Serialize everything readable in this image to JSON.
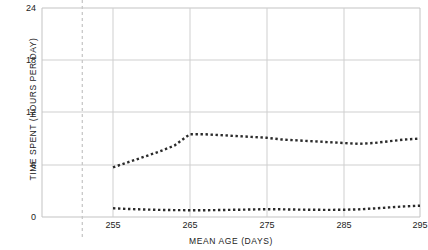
{
  "chart_data": {
    "type": "line",
    "title": "",
    "xlabel": "MEAN AGE (DAYS)",
    "ylabel": "TIME SPENT (HOURS PER DAY)",
    "xlim": [
      247,
      295
    ],
    "ylim": [
      0,
      24
    ],
    "xticks": [
      255,
      265,
      275,
      285,
      295
    ],
    "yticks": [
      0,
      6,
      12,
      18,
      24
    ],
    "xticklabels": [
      "255",
      "265",
      "275",
      "285",
      "295"
    ],
    "yticklabels": [
      "0",
      "6",
      "12",
      "18",
      "24"
    ],
    "grid": "both",
    "legend": "none",
    "annotations": [
      {
        "name": "reference-line",
        "type": "vline",
        "x": 251,
        "style": "dashed",
        "color": "#c8c8c8"
      }
    ],
    "series": [
      {
        "name": "upper-series",
        "style": "dotted",
        "color": "#2b2b2b",
        "x": [
          255,
          257,
          259,
          261,
          263,
          265,
          267,
          269,
          271,
          273,
          275,
          277,
          279,
          281,
          283,
          285,
          287,
          289,
          291,
          293,
          295
        ],
        "values": [
          5.7,
          6.3,
          6.9,
          7.5,
          8.2,
          9.5,
          9.5,
          9.4,
          9.3,
          9.2,
          9.1,
          8.9,
          8.8,
          8.7,
          8.6,
          8.5,
          8.4,
          8.5,
          8.7,
          8.9,
          9.0
        ]
      },
      {
        "name": "lower-series",
        "style": "dotted",
        "color": "#2b2b2b",
        "x": [
          255,
          257,
          259,
          261,
          263,
          265,
          267,
          269,
          271,
          273,
          275,
          277,
          279,
          281,
          283,
          285,
          287,
          289,
          291,
          293,
          295
        ],
        "values": [
          1.0,
          0.92,
          0.86,
          0.82,
          0.79,
          0.78,
          0.78,
          0.8,
          0.83,
          0.86,
          0.9,
          0.88,
          0.85,
          0.83,
          0.82,
          0.83,
          0.88,
          0.98,
          1.1,
          1.22,
          1.3
        ]
      }
    ]
  },
  "axes": {
    "frame_color": "#c3c3c3",
    "grid_color": "#cfcfcf",
    "text_color": "#232323"
  }
}
